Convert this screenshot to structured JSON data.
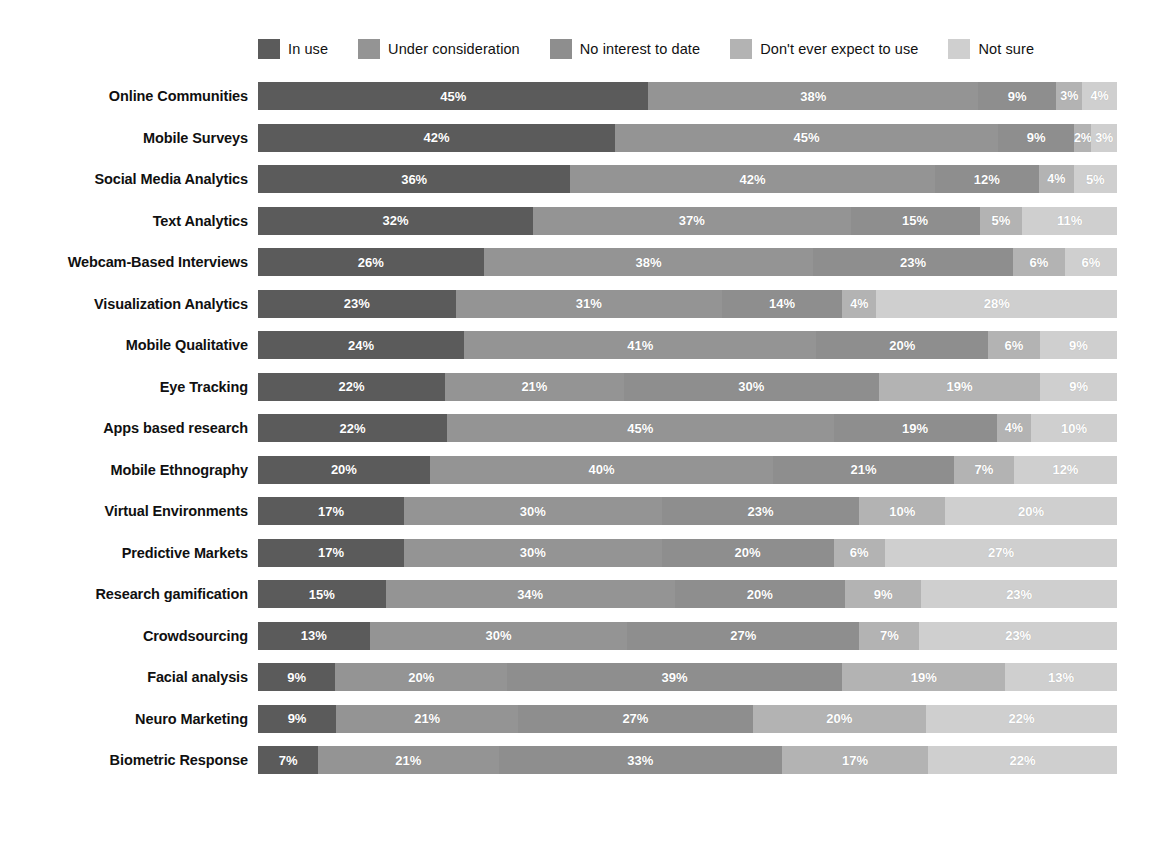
{
  "legend": {
    "items": [
      {
        "label": "In use",
        "color": "#5b5b5b"
      },
      {
        "label": "Under consideration",
        "color": "#949494"
      },
      {
        "label": "No interest to date",
        "color": "#8e8e8e"
      },
      {
        "label": "Don't ever expect to use",
        "color": "#b3b3b3"
      },
      {
        "label": "Not sure",
        "color": "#cfcfcf"
      }
    ]
  },
  "chart_data": {
    "type": "bar",
    "orientation": "horizontal",
    "stacked": true,
    "normalized_percent": true,
    "title": "",
    "subtitle": "",
    "xlabel": "",
    "ylabel": "",
    "xlim": [
      0,
      100
    ],
    "grid": false,
    "legend_position": "top",
    "value_suffix": "%",
    "series_names": [
      "In use",
      "Under consideration",
      "No interest to date",
      "Don't ever expect to use",
      "Not sure"
    ],
    "series_colors": [
      "#5b5b5b",
      "#949494",
      "#8e8e8e",
      "#b3b3b3",
      "#cfcfcf"
    ],
    "categories": [
      "Online Communities",
      "Mobile Surveys",
      "Social Media Analytics",
      "Text Analytics",
      "Webcam-Based Interviews",
      "Visualization Analytics",
      "Mobile Qualitative",
      "Eye Tracking",
      "Apps based research",
      "Mobile Ethnography",
      "Virtual Environments",
      "Predictive Markets",
      "Research gamification",
      "Crowdsourcing",
      "Facial analysis",
      "Neuro Marketing",
      "Biometric Response"
    ],
    "series": [
      {
        "name": "In use",
        "values": [
          45,
          42,
          36,
          32,
          26,
          23,
          24,
          22,
          22,
          20,
          17,
          17,
          15,
          13,
          9,
          9,
          7
        ]
      },
      {
        "name": "Under consideration",
        "values": [
          38,
          45,
          42,
          37,
          38,
          31,
          41,
          21,
          45,
          40,
          30,
          30,
          34,
          30,
          20,
          21,
          21
        ]
      },
      {
        "name": "No interest to date",
        "values": [
          9,
          9,
          12,
          15,
          23,
          14,
          20,
          30,
          19,
          21,
          23,
          20,
          20,
          27,
          39,
          27,
          33
        ]
      },
      {
        "name": "Don't ever expect to use",
        "values": [
          3,
          2,
          4,
          5,
          6,
          4,
          6,
          19,
          4,
          7,
          10,
          6,
          9,
          7,
          19,
          20,
          17
        ]
      },
      {
        "name": "Not sure",
        "values": [
          4,
          3,
          5,
          11,
          6,
          28,
          9,
          9,
          10,
          12,
          20,
          27,
          23,
          23,
          13,
          22,
          22
        ]
      }
    ],
    "rows": [
      {
        "category": "Online Communities",
        "values": [
          45,
          38,
          9,
          3,
          4
        ],
        "labels": [
          "45%",
          "38%",
          "9%",
          "3%",
          "4%"
        ]
      },
      {
        "category": "Mobile Surveys",
        "values": [
          42,
          45,
          9,
          2,
          3
        ],
        "labels": [
          "42%",
          "45%",
          "9%",
          "2%",
          "3%"
        ]
      },
      {
        "category": "Social Media Analytics",
        "values": [
          36,
          42,
          12,
          4,
          5
        ],
        "labels": [
          "36%",
          "42%",
          "12%",
          "4%",
          "5%"
        ]
      },
      {
        "category": "Text Analytics",
        "values": [
          32,
          37,
          15,
          5,
          11
        ],
        "labels": [
          "32%",
          "37%",
          "15%",
          "5%",
          "11%"
        ]
      },
      {
        "category": "Webcam-Based Interviews",
        "values": [
          26,
          38,
          23,
          6,
          6
        ],
        "labels": [
          "26%",
          "38%",
          "23%",
          "6%",
          "6%"
        ]
      },
      {
        "category": "Visualization Analytics",
        "values": [
          23,
          31,
          14,
          4,
          28
        ],
        "labels": [
          "23%",
          "31%",
          "14%",
          "4%",
          "28%"
        ]
      },
      {
        "category": "Mobile Qualitative",
        "values": [
          24,
          41,
          20,
          6,
          9
        ],
        "labels": [
          "24%",
          "41%",
          "20%",
          "6%",
          "9%"
        ]
      },
      {
        "category": "Eye Tracking",
        "values": [
          22,
          21,
          30,
          19,
          9
        ],
        "labels": [
          "22%",
          "21%",
          "30%",
          "19%",
          "9%"
        ]
      },
      {
        "category": "Apps based research",
        "values": [
          22,
          45,
          19,
          4,
          10
        ],
        "labels": [
          "22%",
          "45%",
          "19%",
          "4%",
          "10%"
        ]
      },
      {
        "category": "Mobile Ethnography",
        "values": [
          20,
          40,
          21,
          7,
          12
        ],
        "labels": [
          "20%",
          "40%",
          "21%",
          "7%",
          "12%"
        ]
      },
      {
        "category": "Virtual Environments",
        "values": [
          17,
          30,
          23,
          10,
          20
        ],
        "labels": [
          "17%",
          "30%",
          "23%",
          "10%",
          "20%"
        ]
      },
      {
        "category": "Predictive Markets",
        "values": [
          17,
          30,
          20,
          6,
          27
        ],
        "labels": [
          "17%",
          "30%",
          "20%",
          "6%",
          "27%"
        ]
      },
      {
        "category": "Research gamification",
        "values": [
          15,
          34,
          20,
          9,
          23
        ],
        "labels": [
          "15%",
          "34%",
          "20%",
          "9%",
          "23%"
        ]
      },
      {
        "category": "Crowdsourcing",
        "values": [
          13,
          30,
          27,
          7,
          23
        ],
        "labels": [
          "13%",
          "30%",
          "27%",
          "7%",
          "23%"
        ]
      },
      {
        "category": "Facial analysis",
        "values": [
          9,
          20,
          39,
          19,
          13
        ],
        "labels": [
          "9%",
          "20%",
          "39%",
          "19%",
          "13%"
        ]
      },
      {
        "category": "Neuro Marketing",
        "values": [
          9,
          21,
          27,
          20,
          22
        ],
        "labels": [
          "9%",
          "21%",
          "27%",
          "20%",
          "22%"
        ]
      },
      {
        "category": "Biometric Response",
        "values": [
          7,
          21,
          33,
          17,
          22
        ],
        "labels": [
          "7%",
          "21%",
          "33%",
          "17%",
          "22%"
        ]
      }
    ]
  }
}
